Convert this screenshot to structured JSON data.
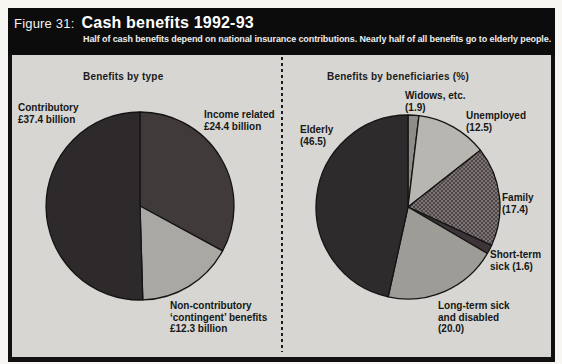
{
  "figure": {
    "label": "Figure 31:",
    "title": "Cash benefits 1992-93",
    "subtitle": "Half of cash benefits depend on national insurance contributions. Nearly half of all benefits go to elderly people."
  },
  "colors": {
    "header_bg": "#0c0c0c",
    "panel_bg": "#d7d6d2",
    "outline": "#141414",
    "divider": "#1c1c1c",
    "label_text": "#161616"
  },
  "chart_data": [
    {
      "type": "pie",
      "title": "Benefits by type",
      "unit": "£ billion",
      "start_angle_deg": 0,
      "direction": "clockwise",
      "slices": [
        {
          "name": "Income related",
          "value": 24.4,
          "color": "#413a3b",
          "label_lines": [
            "Income related",
            "£24.4 billion"
          ]
        },
        {
          "name": "Non-contributory 'contingent' benefits",
          "value": 12.3,
          "color": "#a9a8a3",
          "label_lines": [
            "Non-contributory",
            "‘contingent’ benefits",
            "£12.3 billion"
          ]
        },
        {
          "name": "Contributory",
          "value": 37.4,
          "color": "#2e2a2b",
          "label_lines": [
            "Contributory",
            "£37.4 billion"
          ]
        }
      ]
    },
    {
      "type": "pie",
      "title": "Benefits by beneficiaries (%)",
      "unit": "%",
      "start_angle_deg": 0,
      "direction": "clockwise",
      "slices": [
        {
          "name": "Widows, etc.",
          "value": 1.9,
          "color": "#8e8d89",
          "label_lines": [
            "Widows, etc.",
            "(1.9)"
          ]
        },
        {
          "name": "Unemployed",
          "value": 12.5,
          "color": "#b7b6b1",
          "label_lines": [
            "Unemployed",
            "(12.5)"
          ]
        },
        {
          "name": "Family",
          "value": 17.4,
          "color": "#4e4647",
          "texture": "crosshatch",
          "label_lines": [
            "Family",
            "(17.4)"
          ]
        },
        {
          "name": "Short-term sick",
          "value": 1.6,
          "color": "#3c3436",
          "label_lines": [
            "Short-term",
            "sick  (1.6)"
          ]
        },
        {
          "name": "Long-term sick and disabled",
          "value": 20.0,
          "color": "#9d9c97",
          "label_lines": [
            "Long-term sick",
            "and disabled",
            "(20.0)"
          ]
        },
        {
          "name": "Elderly",
          "value": 46.5,
          "color": "#2e2b2c",
          "label_lines": [
            "Elderly",
            "(46.5)"
          ]
        }
      ]
    }
  ]
}
